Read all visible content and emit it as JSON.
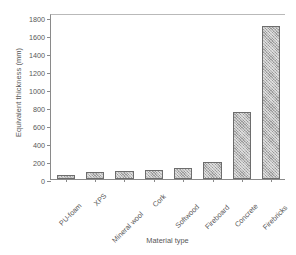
{
  "chart_data": {
    "type": "bar",
    "title": "",
    "xlabel": "Material type",
    "ylabel": "Equivalent thickness (mm)",
    "categories": [
      "PU-foam",
      "XPS",
      "Mineral wool",
      "Cork",
      "Softwood",
      "Fireboard",
      "Concrete",
      "Firebricks"
    ],
    "values": [
      50,
      80,
      85,
      95,
      125,
      195,
      750,
      1710
    ],
    "ylim": [
      0,
      1850
    ],
    "yticks": [
      0,
      200,
      400,
      600,
      800,
      1000,
      1200,
      1400,
      1600,
      1800
    ],
    "ytick_labels": [
      "0",
      "200",
      "400",
      "600",
      "800",
      "1000",
      "1200",
      "1400",
      "1600",
      "1800"
    ],
    "grid": false,
    "legend": null,
    "bar_fill": "#9a9a9a",
    "bar_edge": "#6d6d6d",
    "bar_pattern": "diagonal-hatch",
    "axis_color": "#8a8a8a",
    "text_color": "#575757",
    "background": "#ffffff"
  }
}
